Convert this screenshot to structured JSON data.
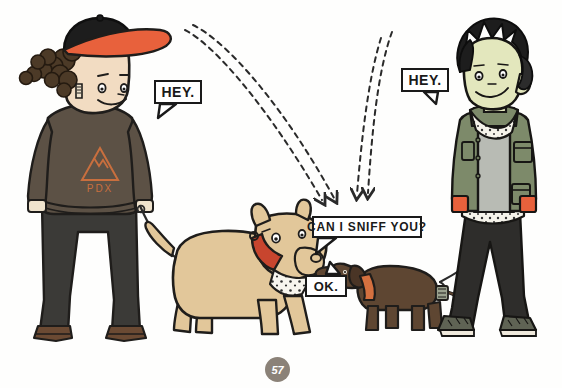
{
  "page": {
    "number": "57",
    "background_color": "#fefefd"
  },
  "speech_bubbles": [
    {
      "id": "hey-left",
      "text": "HEY."
    },
    {
      "id": "hey-right",
      "text": "HEY."
    },
    {
      "id": "sniff",
      "text": "CAN I SNIFF YOU?"
    },
    {
      "id": "ok",
      "text": "OK."
    }
  ],
  "characters": {
    "left_person": {
      "name": "person-with-cap",
      "cap_crown_color": "#1d1d1d",
      "cap_brim_color": "#e8613c",
      "hair_color": "#4c3a27",
      "skin_color": "#f2dcc2",
      "shirt_color": "#5c5145",
      "shirt_graphic": "PDX",
      "shirt_graphic_color": "#d4713f",
      "pants_color": "#3b3a37",
      "shoes_color": "#6b4a33"
    },
    "right_person": {
      "name": "person-with-black-hair",
      "hair_color": "#1d1d1d",
      "skin_color": "#e3e7bd",
      "jacket_color": "#7d8a6a",
      "shirt_color": "#b8bbb4",
      "bandana_color": "#f5f3ea",
      "cuff_color": "#e8613c",
      "pants_color": "#2e2d2b",
      "shoes_color": "#5f6354"
    }
  },
  "dogs": {
    "big_dog": {
      "name": "pit-bull",
      "body_color": "#e2c79a",
      "collar_color": "#c8452e",
      "bandana_color": "#f7f5ee"
    },
    "small_dog": {
      "name": "dachshund",
      "body_color": "#5e4632",
      "collar_color": "#d4703f"
    }
  },
  "gaze_arrows": {
    "style": "dashed",
    "color": "#2a2a2a",
    "count": 2
  },
  "leashes": {
    "color": "#2a2a2a",
    "count": 2
  }
}
